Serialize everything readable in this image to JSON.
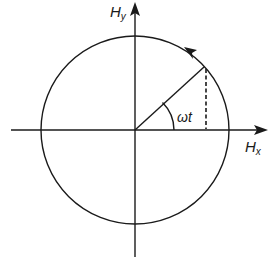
{
  "diagram": {
    "labels": {
      "y_axis_main": "H",
      "y_axis_sub": "y",
      "x_axis_main": "H",
      "x_axis_sub": "x",
      "angle": "ωt"
    },
    "colors": {
      "stroke": "#1a1a1a",
      "background": "#ffffff"
    }
  }
}
